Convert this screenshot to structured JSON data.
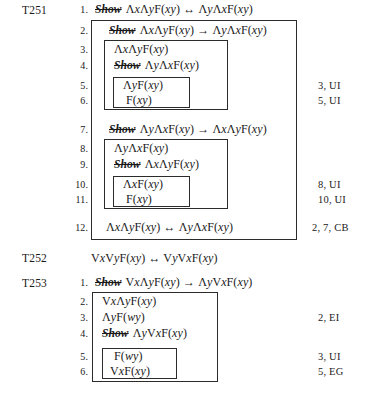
{
  "document": {
    "type": "logic-proof-page",
    "theorems": [
      {
        "id": "t251",
        "label": "T251",
        "lines": [
          {
            "no": "1.",
            "show": true,
            "formula": "ΛxΛyF(xy) ↔ ΛyΛxF(xy)",
            "annotation": ""
          },
          {
            "no": "2.",
            "show": true,
            "formula": "ΛxΛyF(xy) → ΛyΛxF(xy)",
            "annotation": ""
          },
          {
            "no": "3.",
            "show": false,
            "formula": "ΛxΛyF(xy)",
            "annotation": ""
          },
          {
            "no": "4.",
            "show": true,
            "formula": "ΛyΛxF(xy)",
            "annotation": ""
          },
          {
            "no": "5.",
            "show": false,
            "formula": "ΛyF(xy)",
            "annotation": "3, UI"
          },
          {
            "no": "6.",
            "show": false,
            "formula": "F(xy)",
            "annotation": "5, UI"
          },
          {
            "no": "7.",
            "show": true,
            "formula": "ΛyΛxF(xy) → ΛxΛyF(xy)",
            "annotation": ""
          },
          {
            "no": "8.",
            "show": false,
            "formula": "ΛyΛxF(xy)",
            "annotation": ""
          },
          {
            "no": "9.",
            "show": true,
            "formula": "ΛxΛyF(xy)",
            "annotation": ""
          },
          {
            "no": "10.",
            "show": false,
            "formula": "ΛxF(xy)",
            "annotation": "8, UI"
          },
          {
            "no": "11.",
            "show": false,
            "formula": "F(xy)",
            "annotation": "10, UI"
          },
          {
            "no": "12.",
            "show": false,
            "formula": "ΛxΛyF(xy) ↔ ΛyΛxF(xy)",
            "annotation": "2, 7, CB"
          }
        ]
      },
      {
        "id": "t252",
        "label": "T252",
        "statement": "VxVyF(xy) ↔ VyVxF(xy)",
        "lines": []
      },
      {
        "id": "t253",
        "label": "T253",
        "lines": [
          {
            "no": "1.",
            "show": true,
            "formula": "VxΛyF(xy) → ΛyVxF(xy)",
            "annotation": ""
          },
          {
            "no": "2.",
            "show": false,
            "formula": "VxΛyF(xy)",
            "annotation": ""
          },
          {
            "no": "3.",
            "show": false,
            "formula": "ΛyF(wy)",
            "annotation": "2, EI"
          },
          {
            "no": "4.",
            "show": true,
            "formula": "ΛyVxF(xy)",
            "annotation": ""
          },
          {
            "no": "5.",
            "show": false,
            "formula": "F(wy)",
            "annotation": "3, UI"
          },
          {
            "no": "6.",
            "show": false,
            "formula": "VxF(xy)",
            "annotation": "5, EG"
          }
        ]
      }
    ],
    "show_keyword": "Show"
  }
}
